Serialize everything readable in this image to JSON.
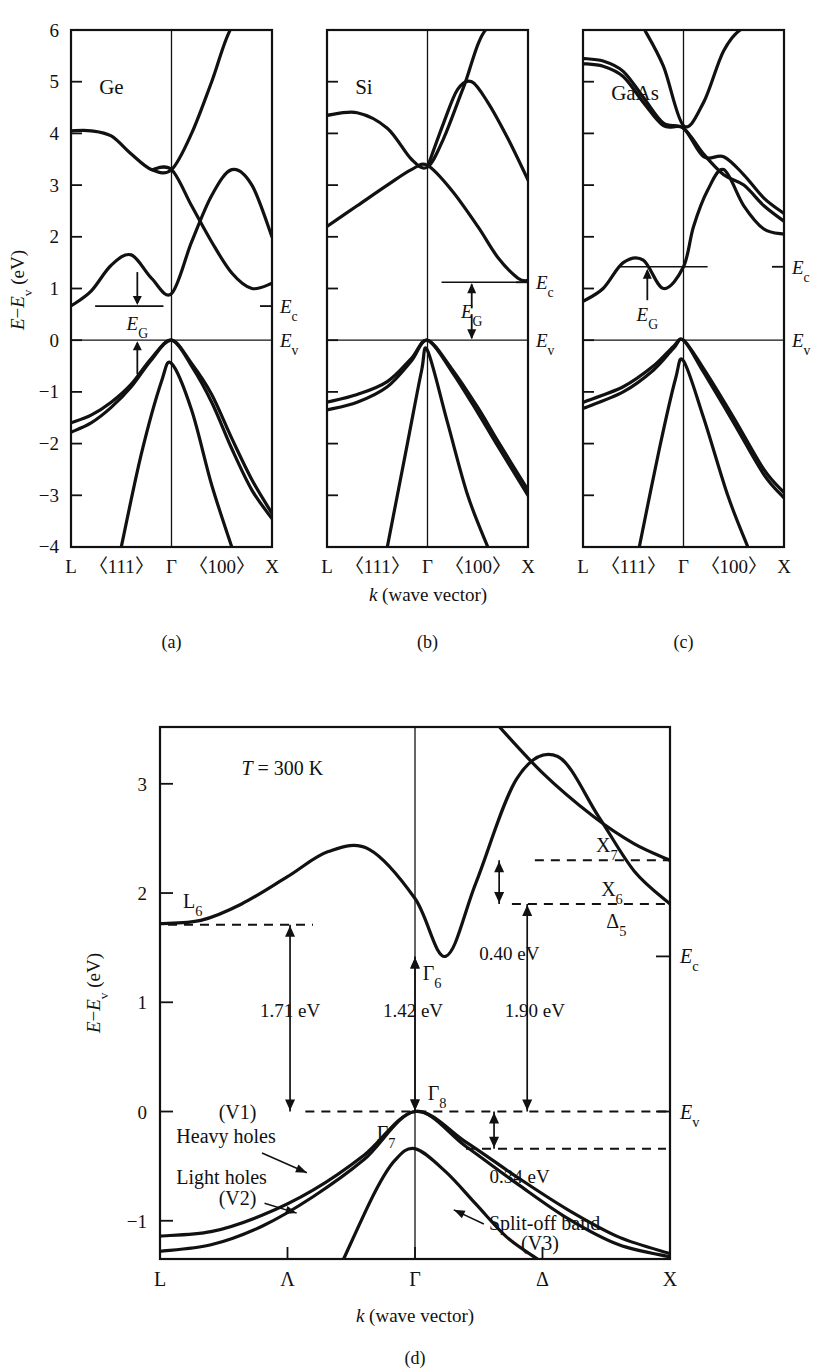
{
  "figure": {
    "axis_y_label_parts": {
      "E": "E",
      "minus": "−",
      "Ev": "E",
      "v_sub": "v",
      "unit": "(eV)"
    },
    "axis_y_label": "E−Ev (eV)",
    "axis_x_label": "k (wave vector)",
    "axis_x_label_italic": "k",
    "axis_x_label_rest": "(wave vector)"
  },
  "top_panels": {
    "yticks": [
      "6",
      "5",
      "4",
      "3",
      "2",
      "1",
      "0",
      "−1",
      "−2",
      "−3",
      "−4"
    ],
    "ytick_values": [
      6,
      5,
      4,
      3,
      2,
      1,
      0,
      -1,
      -2,
      -3,
      -4
    ],
    "ylim": [
      -4,
      6
    ],
    "xticks": [
      "L",
      "〈111〉",
      "Γ",
      "〈100〉",
      "X"
    ],
    "gap_label": "E",
    "gap_sub": "G",
    "ec_label": "E",
    "ec_sub": "c",
    "ev_label": "E",
    "ev_sub": "v",
    "panels": [
      {
        "id": "a",
        "material": "Ge",
        "caption": "(a)",
        "ec": 0.66,
        "ev": 0.0
      },
      {
        "id": "b",
        "material": "Si",
        "caption": "(b)",
        "ec": 1.12,
        "ev": 0.0
      },
      {
        "id": "c",
        "material": "GaAs",
        "caption": "(c)",
        "ec": 1.42,
        "ev": 0.0
      }
    ]
  },
  "bottom_panel": {
    "caption": "(d)",
    "temperature": "T = 300 K",
    "temperature_italic": "T",
    "temperature_rest": "= 300 K",
    "yticks": [
      "3",
      "2",
      "1",
      "0",
      "−1"
    ],
    "ytick_values": [
      3,
      2,
      1,
      0,
      -1
    ],
    "ylim": [
      -1.35,
      3.5
    ],
    "xticks": [
      "L",
      "Λ",
      "Γ",
      "Δ",
      "X"
    ],
    "band_labels": [
      {
        "name": "L6",
        "base": "L",
        "sub": "6"
      },
      {
        "name": "Gamma6",
        "base": "Γ",
        "sub": "6"
      },
      {
        "name": "Gamma8",
        "base": "Γ",
        "sub": "8"
      },
      {
        "name": "Gamma7",
        "base": "Γ",
        "sub": "7"
      },
      {
        "name": "X7",
        "base": "X",
        "sub": "7"
      },
      {
        "name": "X6",
        "base": "X",
        "sub": "6"
      },
      {
        "name": "Delta5",
        "base": "Δ",
        "sub": "5"
      }
    ],
    "energy_annotations": [
      {
        "label": "1.71 eV",
        "value": 1.71
      },
      {
        "label": "1.42 eV",
        "value": 1.42
      },
      {
        "label": "1.90 eV",
        "value": 1.9
      },
      {
        "label": "0.40 eV",
        "value": 0.4
      },
      {
        "label": "0.34 eV",
        "value": 0.34
      }
    ],
    "valence_band_labels": [
      {
        "text": "(V1)",
        "name": "v1"
      },
      {
        "text": "Heavy holes",
        "name": "heavy-holes"
      },
      {
        "text": "Light holes",
        "name": "light-holes"
      },
      {
        "text": "(V2)",
        "name": "v2"
      },
      {
        "text": "Split-off band",
        "name": "split-off-band"
      },
      {
        "text": "(V3)",
        "name": "v3"
      }
    ],
    "ec_label": "E",
    "ec_sub": "c",
    "ev_label": "E",
    "ev_sub": "v"
  },
  "chart_data": {
    "type": "line",
    "xlabel": "k (wave vector)",
    "ylabel": "E−Ev (eV)",
    "grid": false,
    "legend": "none",
    "subplots": [
      {
        "id": "a",
        "label": "(a)",
        "material": "Ge",
        "ylim": [
          -4,
          6
        ],
        "xticks": [
          "L",
          "〈111〉",
          "Γ",
          "〈100〉",
          "X"
        ],
        "annotations": [
          "E_G",
          "E_c",
          "E_v"
        ],
        "Ec": 0.66,
        "Ev": 0.0,
        "bandgap_eV": 0.66,
        "gap_type": "indirect",
        "series": [
          {
            "name": "conduction-upper",
            "x": [
              0,
              0.1,
              0.2,
              0.3,
              0.4,
              0.5,
              0.6,
              0.7,
              0.8,
              0.9,
              1.0
            ],
            "y": [
              4.05,
              4.05,
              3.95,
              3.6,
              3.3,
              3.3,
              4.0,
              5.0,
              6.2,
              7.4,
              8.4
            ]
          },
          {
            "name": "conduction-lower",
            "x": [
              0,
              0.1,
              0.2,
              0.3,
              0.4,
              0.5,
              0.6,
              0.7,
              0.8,
              0.9,
              1.0
            ],
            "y": [
              0.66,
              0.95,
              1.45,
              1.65,
              1.2,
              0.9,
              1.9,
              2.8,
              3.3,
              3.0,
              2.0
            ]
          },
          {
            "name": "conduction-cross",
            "x": [
              0.4,
              0.5,
              0.6,
              0.7,
              0.8,
              0.9,
              1.0
            ],
            "y": [
              3.3,
              3.3,
              2.6,
              1.9,
              1.3,
              1.0,
              1.1
            ]
          },
          {
            "name": "heavy-hole",
            "x": [
              0,
              0.1,
              0.2,
              0.3,
              0.4,
              0.5,
              0.6,
              0.7,
              0.8,
              0.9,
              1.0
            ],
            "y": [
              -1.6,
              -1.45,
              -1.2,
              -0.85,
              -0.35,
              0.0,
              -0.45,
              -1.05,
              -1.9,
              -2.7,
              -3.35
            ]
          },
          {
            "name": "light-hole",
            "x": [
              0,
              0.1,
              0.2,
              0.3,
              0.4,
              0.5,
              0.6,
              0.7,
              0.8,
              0.9,
              1.0
            ],
            "y": [
              -1.78,
              -1.6,
              -1.3,
              -0.9,
              -0.38,
              0.0,
              -0.5,
              -1.2,
              -2.1,
              -2.9,
              -3.45
            ]
          },
          {
            "name": "split-off",
            "x": [
              0.25,
              0.35,
              0.45,
              0.5,
              0.6,
              0.7,
              0.8
            ],
            "y": [
              -4.0,
              -2.2,
              -0.8,
              -0.45,
              -1.35,
              -2.8,
              -4.0
            ]
          }
        ]
      },
      {
        "id": "b",
        "label": "(b)",
        "material": "Si",
        "ylim": [
          -4,
          6
        ],
        "xticks": [
          "L",
          "〈111〉",
          "Γ",
          "〈100〉",
          "X"
        ],
        "annotations": [
          "E_G",
          "E_c",
          "E_v"
        ],
        "Ec": 1.12,
        "Ev": 0.0,
        "bandgap_eV": 1.12,
        "gap_type": "indirect",
        "series": [
          {
            "name": "conduction-upper",
            "x": [
              0,
              0.15,
              0.3,
              0.42,
              0.5,
              0.58,
              0.68,
              0.8,
              1.0
            ],
            "y": [
              4.35,
              4.4,
              4.1,
              3.5,
              3.35,
              3.9,
              4.9,
              6.2,
              8.0
            ]
          },
          {
            "name": "conduction-mid",
            "x": [
              0.5,
              0.58,
              0.65,
              0.72,
              0.8,
              0.9,
              1.0
            ],
            "y": [
              3.35,
              4.2,
              4.85,
              5.0,
              4.6,
              3.9,
              3.1
            ]
          },
          {
            "name": "conduction-lower",
            "x": [
              0,
              0.15,
              0.3,
              0.42,
              0.5,
              0.62,
              0.75,
              0.85,
              0.95,
              1.0
            ],
            "y": [
              2.2,
              2.6,
              3.0,
              3.3,
              3.38,
              2.9,
              2.2,
              1.6,
              1.2,
              1.15
            ]
          },
          {
            "name": "valence-upper",
            "x": [
              0,
              0.15,
              0.3,
              0.42,
              0.5,
              0.62,
              0.75,
              0.85,
              1.0
            ],
            "y": [
              -1.2,
              -1.05,
              -0.8,
              -0.35,
              0.0,
              -0.55,
              -1.3,
              -1.95,
              -2.9
            ]
          },
          {
            "name": "valence-lower",
            "x": [
              0,
              0.15,
              0.3,
              0.42,
              0.5,
              0.62,
              0.75,
              0.85,
              1.0
            ],
            "y": [
              -1.35,
              -1.2,
              -0.9,
              -0.4,
              0.0,
              -0.6,
              -1.4,
              -2.05,
              -3.0
            ]
          },
          {
            "name": "split-off",
            "x": [
              0.3,
              0.4,
              0.47,
              0.5,
              0.6,
              0.7,
              0.8
            ],
            "y": [
              -4.0,
              -2.0,
              -0.6,
              -0.2,
              -1.6,
              -3.0,
              -4.0
            ]
          }
        ]
      },
      {
        "id": "c",
        "label": "(c)",
        "material": "GaAs",
        "ylim": [
          -4,
          6
        ],
        "xticks": [
          "L",
          "〈111〉",
          "Γ",
          "〈100〉",
          "X"
        ],
        "annotations": [
          "E_G",
          "E_c",
          "E_v"
        ],
        "Ec": 1.42,
        "Ev": 0.0,
        "bandgap_eV": 1.42,
        "gap_type": "direct",
        "series": [
          {
            "name": "conduction-upper",
            "x": [
              0,
              0.1,
              0.2,
              0.3,
              0.4,
              0.5,
              0.6,
              0.7,
              0.8,
              0.9,
              1.0
            ],
            "y": [
              5.35,
              5.3,
              5.1,
              4.6,
              4.15,
              4.1,
              3.6,
              3.2,
              3.0,
              2.6,
              2.3
            ]
          },
          {
            "name": "conduction-upper2",
            "x": [
              0,
              0.1,
              0.2,
              0.3,
              0.4,
              0.5,
              0.6,
              0.7,
              0.8,
              0.9,
              1.0
            ],
            "y": [
              5.45,
              5.4,
              5.2,
              4.7,
              4.2,
              4.1,
              3.55,
              3.55,
              3.2,
              2.75,
              2.45
            ]
          },
          {
            "name": "conduction-gamma",
            "x": [
              0.3,
              0.4,
              0.5,
              0.6,
              0.7,
              0.8,
              0.9,
              1.0
            ],
            "y": [
              7.0,
              5.3,
              4.15,
              4.6,
              5.6,
              6.8,
              8.0,
              8.6
            ]
          },
          {
            "name": "conduction-lower",
            "x": [
              0,
              0.1,
              0.2,
              0.3,
              0.4,
              0.5,
              0.55,
              0.62,
              0.7,
              0.8,
              0.9,
              1.0
            ],
            "y": [
              0.75,
              1.0,
              1.5,
              1.55,
              1.0,
              1.42,
              2.2,
              2.9,
              3.3,
              2.6,
              2.15,
              2.05
            ]
          },
          {
            "name": "heavy-hole",
            "x": [
              0,
              0.2,
              0.35,
              0.45,
              0.5,
              0.6,
              0.75,
              0.9,
              1.0
            ],
            "y": [
              -1.2,
              -0.9,
              -0.5,
              -0.12,
              0.0,
              -0.55,
              -1.5,
              -2.5,
              -2.95
            ]
          },
          {
            "name": "light-hole",
            "x": [
              0,
              0.2,
              0.35,
              0.45,
              0.5,
              0.6,
              0.75,
              0.9,
              1.0
            ],
            "y": [
              -1.32,
              -1.0,
              -0.58,
              -0.16,
              0.0,
              -0.62,
              -1.6,
              -2.6,
              -3.05
            ]
          },
          {
            "name": "split-off",
            "x": [
              0.28,
              0.38,
              0.46,
              0.5,
              0.6,
              0.72,
              0.82
            ],
            "y": [
              -4.0,
              -2.1,
              -0.75,
              -0.4,
              -1.5,
              -3.0,
              -4.0
            ]
          }
        ]
      },
      {
        "id": "d",
        "label": "(d)",
        "material": "GaAs",
        "ylim": [
          -1.35,
          3.5
        ],
        "xticks": [
          "L",
          "Λ",
          "Γ",
          "Δ",
          "X"
        ],
        "annotations": [
          "T = 300 K",
          "L6",
          "Γ 6",
          "Γ 8",
          "Γ 7",
          "X7",
          "X6",
          "Δ 5",
          "1.71 eV",
          "1.42 eV",
          "1.90 eV",
          "0.40 eV",
          "0.34 eV",
          "E_c",
          "E_v",
          "Heavy holes (V1)",
          "Light holes (V2)",
          "Split-off band (V3)"
        ],
        "levels": {
          "L6": 1.71,
          "Gamma6": 1.42,
          "Gamma8": 0.0,
          "Gamma7": -0.34,
          "X6": 1.9,
          "X7": 2.3,
          "Delta5": 1.9
        },
        "series": [
          {
            "name": "conduction",
            "x": [
              0,
              0.08,
              0.16,
              0.25,
              0.33,
              0.41,
              0.5,
              0.56,
              0.62,
              0.7,
              0.78,
              0.86,
              0.93,
              1.0
            ],
            "y": [
              1.72,
              1.75,
              1.9,
              2.15,
              2.38,
              2.4,
              1.95,
              1.42,
              2.1,
              3.05,
              3.25,
              2.7,
              2.2,
              1.9
            ]
          },
          {
            "name": "upper-conduction-X7",
            "x": [
              0.57,
              0.65,
              0.75,
              0.85,
              0.93,
              1.0
            ],
            "y": [
              4.0,
              3.6,
              3.1,
              2.7,
              2.45,
              2.3
            ]
          },
          {
            "name": "heavy-hole-V1",
            "x": [
              0,
              0.1,
              0.2,
              0.3,
              0.4,
              0.5,
              0.6,
              0.7,
              0.8,
              0.9,
              1.0
            ],
            "y": [
              -1.14,
              -1.1,
              -0.95,
              -0.72,
              -0.4,
              0.0,
              -0.28,
              -0.6,
              -0.9,
              -1.15,
              -1.3
            ]
          },
          {
            "name": "light-hole-V2",
            "x": [
              0,
              0.1,
              0.2,
              0.3,
              0.4,
              0.5,
              0.6,
              0.7,
              0.8,
              0.9,
              1.0
            ],
            "y": [
              -1.28,
              -1.22,
              -1.05,
              -0.78,
              -0.44,
              0.0,
              -0.32,
              -0.66,
              -0.98,
              -1.22,
              -1.33
            ]
          },
          {
            "name": "split-off-V3",
            "x": [
              0.36,
              0.42,
              0.46,
              0.5,
              0.56,
              0.62,
              0.68,
              0.74
            ],
            "y": [
              -1.35,
              -0.75,
              -0.45,
              -0.34,
              -0.55,
              -0.85,
              -1.15,
              -1.35
            ]
          }
        ]
      }
    ]
  }
}
